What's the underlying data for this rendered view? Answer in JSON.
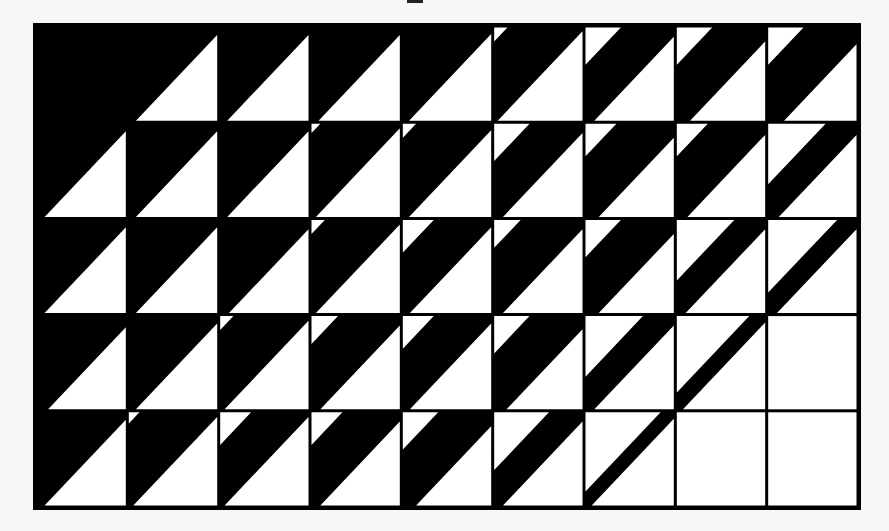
{
  "figure": {
    "grid": {
      "x": 36,
      "y": 26,
      "width": 822,
      "height": 481,
      "rows": 5,
      "cols": 9
    },
    "colors": {
      "ink": "#000000",
      "paper": "#ffffff",
      "background": "#f7f7f5"
    },
    "cell_model": "each cell = upper-left white triangle with leg fraction a, lower-right white triangle with leg fraction b, black diagonal band between",
    "cells": [
      [
        [
          0,
          0
        ],
        [
          0,
          0.92
        ],
        [
          0,
          0.92
        ],
        [
          0,
          0.92
        ],
        [
          0,
          0.93
        ],
        [
          0.15,
          0.96
        ],
        [
          0.4,
          0.9
        ],
        [
          0.4,
          0.85
        ],
        [
          0.4,
          0.82
        ]
      ],
      [
        [
          0,
          0.92
        ],
        [
          0,
          0.92
        ],
        [
          0,
          0.92
        ],
        [
          0.1,
          0.95
        ],
        [
          0.15,
          0.93
        ],
        [
          0.4,
          0.9
        ],
        [
          0.35,
          0.85
        ],
        [
          0.35,
          0.88
        ],
        [
          0.65,
          0.88
        ]
      ],
      [
        [
          0,
          0.92
        ],
        [
          0,
          0.92
        ],
        [
          0,
          0.9
        ],
        [
          0.15,
          0.95
        ],
        [
          0.35,
          0.92
        ],
        [
          0.3,
          0.9
        ],
        [
          0.4,
          0.85
        ],
        [
          0.65,
          0.9
        ],
        [
          0.78,
          0.9
        ]
      ],
      [
        [
          0,
          0.88
        ],
        [
          0,
          0.92
        ],
        [
          0.15,
          0.95
        ],
        [
          0.3,
          0.9
        ],
        [
          0.35,
          0.92
        ],
        [
          0.4,
          0.86
        ],
        [
          0.65,
          0.9
        ],
        [
          0.82,
          0.93
        ],
        [
          1,
          1
        ]
      ],
      [
        [
          0,
          0.92
        ],
        [
          0.12,
          0.95
        ],
        [
          0.35,
          0.95
        ],
        [
          0.35,
          0.9
        ],
        [
          0.4,
          0.85
        ],
        [
          0.62,
          0.9
        ],
        [
          0.85,
          0.93
        ],
        [
          1,
          1
        ],
        [
          1,
          1
        ]
      ]
    ]
  }
}
